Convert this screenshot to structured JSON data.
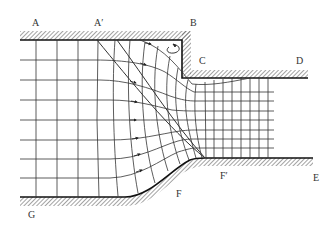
{
  "diagram": {
    "type": "flow-net",
    "labels": {
      "A": "A",
      "A_prime": "A′",
      "B": "B",
      "C": "C",
      "D": "D",
      "E": "E",
      "F": "F",
      "F_prime": "F′",
      "G": "G"
    },
    "colors": {
      "line": "#333333",
      "wall": "#111111",
      "hatch": "#555555",
      "background": "#ffffff"
    },
    "features": {
      "eddy_symbol": "recirculating-eddy-icon",
      "flow_arrows": "arrow-right-icon"
    }
  }
}
